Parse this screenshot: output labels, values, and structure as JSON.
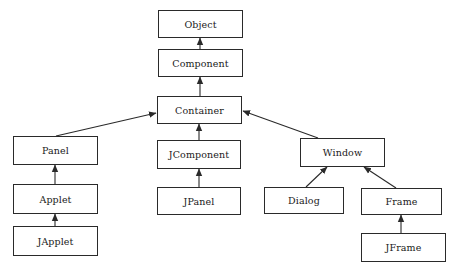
{
  "diagram": {
    "type": "class-hierarchy",
    "nodes": {
      "object": "Object",
      "component": "Component",
      "container": "Container",
      "panel": "Panel",
      "applet": "Applet",
      "japplet": "JApplet",
      "jcomponent": "JComponent",
      "jpanel": "JPanel",
      "window": "Window",
      "dialog": "Dialog",
      "frame": "Frame",
      "jframe": "JFrame"
    },
    "edges": [
      {
        "from": "Component",
        "to": "Object"
      },
      {
        "from": "Container",
        "to": "Component"
      },
      {
        "from": "Panel",
        "to": "Container"
      },
      {
        "from": "JComponent",
        "to": "Container"
      },
      {
        "from": "Window",
        "to": "Container"
      },
      {
        "from": "Applet",
        "to": "Panel"
      },
      {
        "from": "JApplet",
        "to": "Applet"
      },
      {
        "from": "JPanel",
        "to": "JComponent"
      },
      {
        "from": "Dialog",
        "to": "Window"
      },
      {
        "from": "Frame",
        "to": "Window"
      },
      {
        "from": "JFrame",
        "to": "Frame"
      }
    ],
    "colors": {
      "line": "#2a2a2a",
      "background": "#ffffff",
      "text": "#1a1a1a"
    }
  }
}
